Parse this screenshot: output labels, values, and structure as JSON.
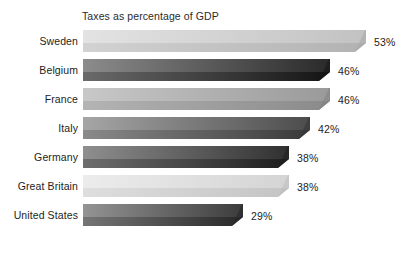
{
  "chart_data": {
    "type": "bar",
    "orientation": "horizontal",
    "title": "Taxes as percentage of GDP",
    "xlabel": "",
    "ylabel": "",
    "xlim": [
      0,
      53
    ],
    "grid": false,
    "legend": "none",
    "value_suffix": "%",
    "categories": [
      "Sweden",
      "Belgium",
      "France",
      "Italy",
      "Germany",
      "Great Britain",
      "United States"
    ],
    "values": [
      53,
      46,
      46,
      42,
      38,
      38,
      29
    ],
    "value_labels": [
      "53%",
      "46%",
      "46%",
      "42%",
      "38%",
      "38%",
      "29%"
    ],
    "bars": [
      {
        "category": "Sweden",
        "value": 53,
        "label": "53%",
        "top_face_light": "#e3e3e3",
        "top_face_dark": "#c2c2c2",
        "front_face_light": "#d2d2d2",
        "front_face_dark": "#b2b2b2",
        "cap_color": "#a8a8a8"
      },
      {
        "category": "Belgium",
        "value": 46,
        "label": "46%",
        "top_face_light": "#8c8c8c",
        "top_face_dark": "#2a2a2a",
        "front_face_light": "#6a6a6a",
        "front_face_dark": "#141414",
        "cap_color": "#161616"
      },
      {
        "category": "France",
        "value": 46,
        "label": "46%",
        "top_face_light": "#c8c8c8",
        "top_face_dark": "#9a9a9a",
        "front_face_light": "#b4b4b4",
        "front_face_dark": "#8a8a8a",
        "cap_color": "#828282"
      },
      {
        "category": "Italy",
        "value": 42,
        "label": "42%",
        "top_face_light": "#a6a6a6",
        "top_face_dark": "#4c4c4c",
        "front_face_light": "#8a8a8a",
        "front_face_dark": "#3a3a3a",
        "cap_color": "#343434"
      },
      {
        "category": "Germany",
        "value": 38,
        "label": "38%",
        "top_face_light": "#8f8f8f",
        "top_face_dark": "#303030",
        "front_face_light": "#6e6e6e",
        "front_face_dark": "#1e1e1e",
        "cap_color": "#1f1f1f"
      },
      {
        "category": "Great Britain",
        "value": 38,
        "label": "38%",
        "top_face_light": "#ececec",
        "top_face_dark": "#d4d4d4",
        "front_face_light": "#dedede",
        "front_face_dark": "#c4c4c4",
        "cap_color": "#bdbdbd"
      },
      {
        "category": "United States",
        "value": 29,
        "label": "29%",
        "top_face_light": "#949494",
        "top_face_dark": "#3c3c3c",
        "front_face_light": "#757575",
        "front_face_dark": "#282828",
        "cap_color": "#272727"
      }
    ],
    "background_color": "#ffffff",
    "text_color": "#1d1d1d"
  }
}
